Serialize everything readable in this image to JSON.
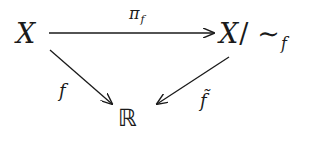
{
  "diagram": {
    "type": "commutative-diagram",
    "nodes": {
      "domain": {
        "text": "X"
      },
      "quotient": {
        "base": "X",
        "slash": "/",
        "tilde": "∼",
        "subscript": "f"
      },
      "codomain": {
        "text": "ℝ"
      }
    },
    "arrows": [
      {
        "id": "pi_f",
        "from": "domain",
        "to": "quotient",
        "label": "π",
        "label_subscript": "f",
        "direction": "horizontal"
      },
      {
        "id": "f",
        "from": "domain",
        "to": "codomain",
        "label": "f",
        "direction": "diagonal-down-right"
      },
      {
        "id": "f_tilde",
        "from": "quotient",
        "to": "codomain",
        "label": "f̃",
        "direction": "diagonal-down-left"
      }
    ],
    "colors": {
      "ink": "#1a1a1a",
      "background": "#ffffff"
    }
  }
}
